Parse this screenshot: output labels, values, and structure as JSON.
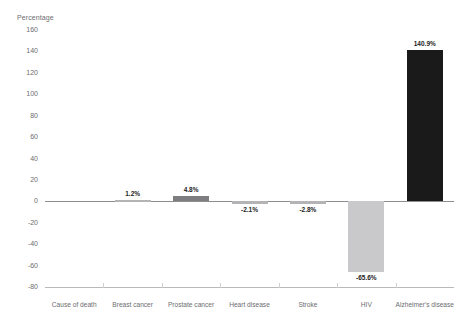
{
  "chart_data": {
    "type": "bar",
    "title": "",
    "xlabel": "Cause of death",
    "ylabel": "Percentage",
    "categories": [
      "Breast cancer",
      "Prostate cancer",
      "Heart disease",
      "Stroke",
      "HIV",
      "Alzheimer's disease"
    ],
    "values": [
      1.2,
      4.8,
      -2.1,
      -2.8,
      -65.6,
      140.9
    ],
    "data_labels": [
      "1.2%",
      "4.8%",
      "-2.1%",
      "-2.8%",
      "-65.6%",
      "140.9%"
    ],
    "bar_colors": [
      "#b4b4b6",
      "#7e7e80",
      "#b4b4b6",
      "#b4b4b6",
      "#c9c9cb",
      "#1a1a1a"
    ],
    "ylim": [
      -80,
      160
    ],
    "ytick_labels": [
      "160",
      "140",
      "120",
      "100",
      "80",
      "60",
      "40",
      "20",
      "0",
      "-20",
      "-40",
      "-60",
      "-80"
    ],
    "ytick_values": [
      160,
      140,
      120,
      100,
      80,
      60,
      40,
      20,
      0,
      -20,
      -40,
      -60,
      -80
    ],
    "grid": false,
    "legend": "none",
    "zero_line": true
  },
  "axis": {
    "y_title": "Percentage",
    "row_header": "Cause of death"
  },
  "colors": {
    "axis_text": "#6d6d6f",
    "zero_line": "#8d8d8f",
    "baseline": "#b9b9bb",
    "label_text": "#1c1c1c",
    "background": "#ffffff"
  }
}
